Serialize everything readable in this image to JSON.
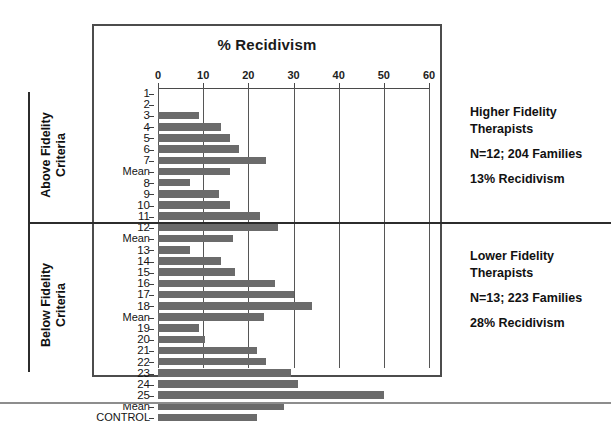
{
  "chart_data": {
    "type": "bar",
    "orientation": "horizontal",
    "title": "% Recidivism",
    "xlabel": "% Recidivism",
    "ylabel": "",
    "xlim": [
      0,
      60
    ],
    "xticks": [
      0,
      10,
      20,
      30,
      40,
      50,
      60
    ],
    "grid": true,
    "legend": "none",
    "bar_color": "#6b6b6b",
    "categories": [
      "1",
      "2",
      "3",
      "4",
      "5",
      "6",
      "7",
      "Mean",
      "8",
      "9",
      "10",
      "11",
      "12",
      "Mean",
      "13",
      "14",
      "15",
      "16",
      "17",
      "18",
      "Mean",
      "19",
      "20",
      "21",
      "22",
      "23",
      "24",
      "25",
      "Mean",
      "CONTROL"
    ],
    "values": [
      0,
      0,
      9,
      14,
      16,
      18,
      24,
      16,
      7,
      13.5,
      16,
      22.5,
      26.5,
      16.5,
      7,
      14,
      17,
      26,
      30,
      34,
      23.5,
      9,
      10.5,
      22,
      24,
      29.5,
      31,
      50,
      28,
      22
    ],
    "groups": [
      {
        "name": "Above Fidelity Criteria",
        "categories": [
          "1",
          "2",
          "3",
          "4",
          "5",
          "6",
          "7",
          "Mean",
          "8",
          "9",
          "10",
          "11",
          "12",
          "Mean"
        ]
      },
      {
        "name": "Below Fidelity Criteria",
        "categories": [
          "13",
          "14",
          "15",
          "16",
          "17",
          "18",
          "Mean",
          "19",
          "20",
          "21",
          "22",
          "23",
          "24",
          "25",
          "Mean"
        ]
      },
      {
        "name": "Control",
        "categories": [
          "CONTROL"
        ]
      }
    ],
    "annotations": [
      "Higher Fidelity Therapists; N=12; 204 Families; 13% Recidivism",
      "Lower Fidelity Therapists; N=13; 223 Families; 28% Recidivism"
    ]
  },
  "axis": {
    "ticks": [
      "0",
      "10",
      "20",
      "30",
      "40",
      "50",
      "60"
    ]
  },
  "side_labels": {
    "above": "Above Fidelity\nCriteria",
    "below": "Below Fidelity\nCriteria"
  },
  "annotations": {
    "upper": {
      "title": "Higher Fidelity\nTherapists",
      "n": "N=12; 204 Families",
      "rate": "13% Recidivism"
    },
    "lower": {
      "title": "Lower Fidelity\nTherapists",
      "n": "N=13; 223 Families",
      "rate": "28% Recidivism"
    }
  }
}
